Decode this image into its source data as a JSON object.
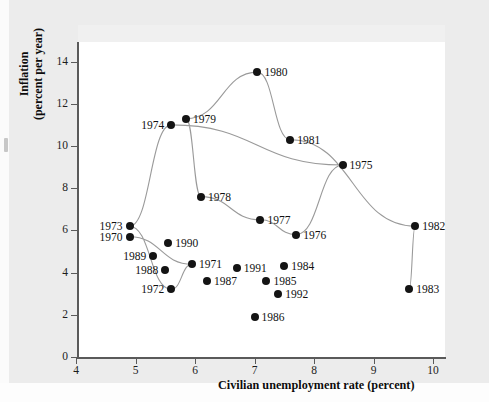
{
  "chart_data": {
    "type": "scatter",
    "title": "",
    "xlabel": "Civilian unemployment rate (percent)",
    "ylabel": "Inflation (percent per year)",
    "xlim": [
      4,
      10.3
    ],
    "ylim": [
      0,
      14.8
    ],
    "xticks": [
      4,
      5,
      6,
      7,
      8,
      9,
      10
    ],
    "yticks": [
      0,
      2,
      4,
      6,
      8,
      10,
      12,
      14
    ],
    "grid": false,
    "legend": "none",
    "connected": true,
    "point_color": "#141414",
    "line_color": "#9a9a9a",
    "points": [
      {
        "label": "1970",
        "x": 4.9,
        "y": 5.7,
        "label_side": "left"
      },
      {
        "label": "1971",
        "x": 5.95,
        "y": 4.4,
        "label_side": "right"
      },
      {
        "label": "1972",
        "x": 5.6,
        "y": 3.2,
        "label_side": "left"
      },
      {
        "label": "1973",
        "x": 4.9,
        "y": 6.2,
        "label_side": "left"
      },
      {
        "label": "1974",
        "x": 5.6,
        "y": 11.0,
        "label_side": "left"
      },
      {
        "label": "1975",
        "x": 8.48,
        "y": 9.1,
        "label_side": "right"
      },
      {
        "label": "1976",
        "x": 7.7,
        "y": 5.8,
        "label_side": "right"
      },
      {
        "label": "1977",
        "x": 7.1,
        "y": 6.5,
        "label_side": "right"
      },
      {
        "label": "1978",
        "x": 6.1,
        "y": 7.6,
        "label_side": "right"
      },
      {
        "label": "1979",
        "x": 5.85,
        "y": 11.3,
        "label_side": "right"
      },
      {
        "label": "1980",
        "x": 7.05,
        "y": 13.5,
        "label_side": "right"
      },
      {
        "label": "1981",
        "x": 7.6,
        "y": 10.3,
        "label_side": "right"
      },
      {
        "label": "1982",
        "x": 9.7,
        "y": 6.2,
        "label_side": "right"
      },
      {
        "label": "1983",
        "x": 9.6,
        "y": 3.2,
        "label_side": "right"
      },
      {
        "label": "1984",
        "x": 7.5,
        "y": 4.3,
        "label_side": "right"
      },
      {
        "label": "1985",
        "x": 7.2,
        "y": 3.6,
        "label_side": "right"
      },
      {
        "label": "1986",
        "x": 7.0,
        "y": 1.9,
        "label_side": "right"
      },
      {
        "label": "1987",
        "x": 6.2,
        "y": 3.6,
        "label_side": "right"
      },
      {
        "label": "1988",
        "x": 5.5,
        "y": 4.1,
        "label_side": "left"
      },
      {
        "label": "1989",
        "x": 5.3,
        "y": 4.8,
        "label_side": "left"
      },
      {
        "label": "1990",
        "x": 5.55,
        "y": 5.4,
        "label_side": "right"
      },
      {
        "label": "1991",
        "x": 6.7,
        "y": 4.2,
        "label_side": "right"
      },
      {
        "label": "1992",
        "x": 7.4,
        "y": 3.0,
        "label_side": "right"
      }
    ],
    "path_order": [
      "1970",
      "1971",
      "1972",
      "1973",
      "1974",
      "1975",
      "1976",
      "1977",
      "1978",
      "1979",
      "1980",
      "1981",
      "1982",
      "1983"
    ]
  }
}
